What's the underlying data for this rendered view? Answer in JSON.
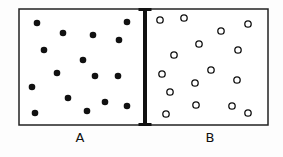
{
  "diagram": {
    "container": {
      "x": 19,
      "y": 9,
      "width": 249,
      "height": 116,
      "stroke": "#222222",
      "stroke_width": 1.5
    },
    "barrier": {
      "x": 145,
      "y_top": 9,
      "y_bottom": 125,
      "width": 4,
      "cap_width": 13,
      "cap_height": 3,
      "color": "#111111"
    },
    "compartments": [
      {
        "id": "A",
        "label": "A",
        "label_x": 80,
        "label_y": 131,
        "particle_type": "filled",
        "particle_color": "#111111",
        "particles": [
          [
            37,
            23
          ],
          [
            63,
            33
          ],
          [
            93,
            35
          ],
          [
            119,
            40
          ],
          [
            127,
            22
          ],
          [
            44,
            50
          ],
          [
            83,
            60
          ],
          [
            57,
            73
          ],
          [
            95,
            76
          ],
          [
            118,
            76
          ],
          [
            32,
            87
          ],
          [
            68,
            98
          ],
          [
            105,
            102
          ],
          [
            127,
            106
          ],
          [
            87,
            111
          ],
          [
            35,
            113
          ]
        ]
      },
      {
        "id": "B",
        "label": "B",
        "label_x": 210,
        "label_y": 131,
        "particle_type": "hollow",
        "particle_color": "#111111",
        "particles": [
          [
            160,
            20
          ],
          [
            184,
            18
          ],
          [
            221,
            31
          ],
          [
            248,
            24
          ],
          [
            199,
            44
          ],
          [
            174,
            55
          ],
          [
            238,
            50
          ],
          [
            162,
            74
          ],
          [
            211,
            70
          ],
          [
            195,
            83
          ],
          [
            237,
            80
          ],
          [
            170,
            92
          ],
          [
            196,
            105
          ],
          [
            232,
            106
          ],
          [
            166,
            114
          ],
          [
            248,
            113
          ]
        ]
      }
    ]
  },
  "labels": {
    "a": "A",
    "b": "B"
  }
}
